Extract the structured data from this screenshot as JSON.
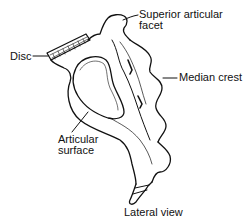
{
  "figure": {
    "caption": "Lateral view",
    "labels": {
      "disc": "Disc",
      "superior_articular_facet_line1": "Superior articular",
      "superior_articular_facet_line2": "facet",
      "median_crest": "Median crest",
      "articular_surface_line1": "Articular",
      "articular_surface_line2": "surface"
    },
    "colors": {
      "line": "#111111",
      "background": "#ffffff"
    }
  }
}
